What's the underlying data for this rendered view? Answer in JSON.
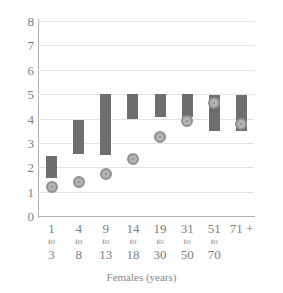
{
  "chart_data": {
    "type": "bar",
    "title": "",
    "xlabel": "Females (years)",
    "ylabel": "",
    "ylim": [
      0,
      8
    ],
    "yticks": [
      0,
      1,
      2,
      3,
      4,
      5,
      6,
      7,
      8
    ],
    "grid": true,
    "legend": "none",
    "categories": [
      "1 to 3",
      "4 to 8",
      "9 to 13",
      "14 to 18",
      "19 to 30",
      "31 to 50",
      "51 to 70",
      "71 +"
    ],
    "category_parts": [
      {
        "start": "1",
        "sep": "to",
        "end": "3"
      },
      {
        "start": "4",
        "sep": "to",
        "end": "8"
      },
      {
        "start": "9",
        "sep": "to",
        "end": "13"
      },
      {
        "start": "14",
        "sep": "to",
        "end": "18"
      },
      {
        "start": "19",
        "sep": "to",
        "end": "30"
      },
      {
        "start": "31",
        "sep": "to",
        "end": "50"
      },
      {
        "start": "51",
        "sep": "to",
        "end": "70"
      },
      {
        "start": "71 +",
        "sep": "",
        "end": ""
      }
    ],
    "series": [
      {
        "name": "range-bar",
        "type": "range",
        "low": [
          1.55,
          2.55,
          2.5,
          4.0,
          4.05,
          4.05,
          3.5,
          3.5
        ],
        "high": [
          2.45,
          3.95,
          5.0,
          5.0,
          5.0,
          5.0,
          4.95,
          4.95
        ]
      },
      {
        "name": "mean-marker",
        "type": "point",
        "values": [
          1.2,
          1.38,
          1.72,
          2.35,
          3.25,
          3.88,
          4.62,
          3.78
        ]
      }
    ]
  },
  "colors": {
    "bar": "#6e6e6e",
    "dot_fill": "#b3b3b3",
    "dot_ring": "#919191",
    "grid": "#e3e3e3",
    "axis": "#b0b0b0",
    "text": "#7d7d7d"
  }
}
